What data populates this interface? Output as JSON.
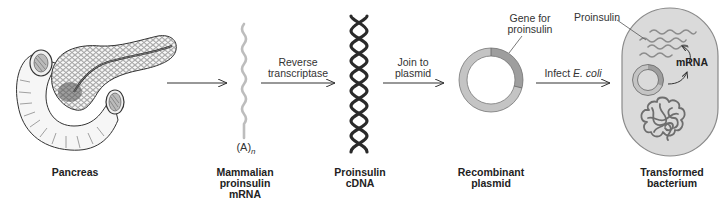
{
  "diagram": {
    "type": "process-flow",
    "colors": {
      "line": "#333333",
      "mrna": "#bdbdbd",
      "dna": "#2a2a2a",
      "plasmid_fill": "#c4c4c4",
      "gene_fill": "#9e9e9e",
      "bacterium_fill": "#dadada",
      "bacterium_outline": "#8a8a8a",
      "text": "#222222"
    },
    "stages": [
      {
        "id": "pancreas",
        "label_lines": [
          "Pancreas"
        ]
      },
      {
        "id": "mrna",
        "label_lines": [
          "Mammalian",
          "proinsulin",
          "mRNA"
        ],
        "annotation_prefix": "(A)",
        "annotation_subscript": "n"
      },
      {
        "id": "cdna",
        "label_lines": [
          "Proinsulin",
          "cDNA"
        ]
      },
      {
        "id": "plasmid",
        "label_lines": [
          "Recombinant",
          "plasmid"
        ],
        "callout_lines": [
          "Gene for",
          "proinsulin"
        ]
      },
      {
        "id": "bacterium",
        "label_lines": [
          "Transformed",
          "bacterium"
        ],
        "callout_proinsulin": "Proinsulin",
        "callout_mrna": "mRNA"
      }
    ],
    "arrows": [
      {
        "from": "pancreas",
        "to": "mrna",
        "label_lines": []
      },
      {
        "from": "mrna",
        "to": "cdna",
        "label_lines": [
          "Reverse",
          "transcriptase"
        ]
      },
      {
        "from": "cdna",
        "to": "plasmid",
        "label_lines": [
          "Join to",
          "plasmid"
        ]
      },
      {
        "from": "plasmid",
        "to": "bacterium",
        "label_prefix": "Infect ",
        "label_italic": "E. coli"
      }
    ]
  }
}
